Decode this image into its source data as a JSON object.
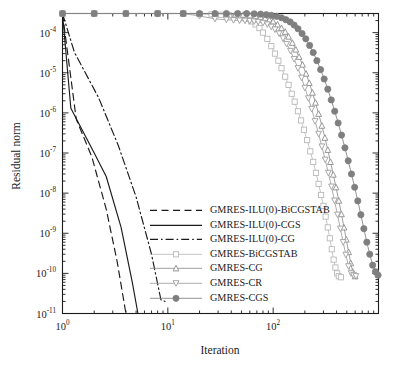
{
  "chart_data": {
    "type": "line",
    "title": "",
    "xlabel": "Iteration",
    "ylabel": "Residual norm",
    "xscale": "log",
    "yscale": "log",
    "xlim": [
      1,
      1000
    ],
    "ylim": [
      1e-11,
      0.0003
    ],
    "grid": false,
    "legend_position": "center-bottom-left",
    "xticks": [
      {
        "value": 1,
        "mantissa": "10",
        "exponent": "0"
      },
      {
        "value": 10,
        "mantissa": "10",
        "exponent": "1"
      },
      {
        "value": 100,
        "mantissa": "10",
        "exponent": "2"
      }
    ],
    "yticks": [
      {
        "value": 0.0001,
        "mantissa": "10",
        "exponent": "-4"
      },
      {
        "value": 1e-05,
        "mantissa": "10",
        "exponent": "-5"
      },
      {
        "value": 1e-06,
        "mantissa": "10",
        "exponent": "-6"
      },
      {
        "value": 1e-07,
        "mantissa": "10",
        "exponent": "-7"
      },
      {
        "value": 1e-08,
        "mantissa": "10",
        "exponent": "-8"
      },
      {
        "value": 1e-09,
        "mantissa": "10",
        "exponent": "-9"
      },
      {
        "value": 1e-10,
        "mantissa": "10",
        "exponent": "-10"
      },
      {
        "value": 1e-11,
        "mantissa": "10",
        "exponent": "-11"
      }
    ],
    "series": [
      {
        "name": "GMRES-ILU(0)-BiCGSTAB",
        "style": "dashed",
        "color": "#1a1a1a",
        "marker": "none",
        "x": [
          1,
          1.35,
          1.9,
          2.6,
          3.3,
          4.0
        ],
        "y": [
          0.0003,
          7e-07,
          8e-08,
          4e-09,
          2e-10,
          1e-11
        ]
      },
      {
        "name": "GMRES-ILU(0)-CGS",
        "style": "solid",
        "color": "#1a1a1a",
        "marker": "none",
        "x": [
          1,
          1.2,
          2.0,
          2.6,
          3.6,
          4.6,
          5.2
        ],
        "y": [
          0.0003,
          1.3e-06,
          1e-07,
          2.6e-08,
          1.4e-09,
          6e-11,
          1e-11
        ]
      },
      {
        "name": "GMRES-ILU(0)-CG",
        "style": "dashdot",
        "color": "#1a1a1a",
        "marker": "none",
        "x": [
          1,
          1.3,
          2.2,
          3.4,
          5.0,
          7.0,
          8.6,
          9.4
        ],
        "y": [
          0.0003,
          3.2e-05,
          2.4e-06,
          1.5e-07,
          8e-09,
          3e-10,
          2.2e-11,
          2e-11
        ]
      },
      {
        "name": "GMRES-BiCGSTAB",
        "style": "solid",
        "color": "#b9b9b9",
        "marker": "square",
        "x": [
          1,
          2,
          4,
          8,
          14,
          20,
          26,
          32,
          38,
          44,
          50,
          56,
          62,
          68,
          74,
          80,
          88,
          96,
          104,
          112,
          120,
          130,
          140,
          150,
          160,
          172,
          184,
          196,
          210,
          225,
          240,
          255,
          270,
          285,
          300,
          315,
          330,
          345,
          360,
          375,
          390,
          405,
          420,
          440
        ],
        "y": [
          0.0003,
          0.0003,
          0.0003,
          0.0003,
          0.0003,
          0.00029,
          0.000285,
          0.00028,
          0.00027,
          0.00026,
          0.00024,
          0.00022,
          0.00019,
          0.00016,
          0.00013,
          0.0001,
          7e-05,
          4.6e-05,
          3e-05,
          2e-05,
          1.3e-05,
          8e-06,
          5e-06,
          3e-06,
          1.9e-06,
          1.1e-06,
          6.5e-07,
          3.8e-07,
          2.1e-07,
          1.1e-07,
          6e-08,
          3.2e-08,
          1.7e-08,
          9e-09,
          4.8e-09,
          2.6e-09,
          1.4e-09,
          7.5e-10,
          4e-10,
          2.2e-10,
          1.4e-10,
          1e-10,
          8.5e-11,
          8e-11
        ]
      },
      {
        "name": "GMRES-CG",
        "style": "solid",
        "color": "#8c8c8c",
        "marker": "triangle-up",
        "x": [
          1,
          2,
          4,
          8,
          14,
          20,
          28,
          36,
          44,
          52,
          60,
          68,
          76,
          84,
          92,
          100,
          110,
          120,
          130,
          140,
          152,
          164,
          176,
          190,
          205,
          220,
          236,
          252,
          270,
          290,
          310,
          330,
          350,
          372,
          395,
          420,
          445,
          470,
          495,
          520,
          545,
          570,
          600
        ],
        "y": [
          0.0003,
          0.0003,
          0.0003,
          0.0003,
          0.0003,
          0.0003,
          0.000295,
          0.00029,
          0.000285,
          0.00028,
          0.00027,
          0.00026,
          0.000245,
          0.00023,
          0.00021,
          0.00019,
          0.00016,
          0.00013,
          0.000105,
          8e-05,
          5.6e-05,
          3.8e-05,
          2.5e-05,
          1.6e-05,
          9.5e-06,
          5.6e-06,
          3.2e-06,
          1.8e-06,
          9.5e-07,
          4.8e-07,
          2.4e-07,
          1.2e-07,
          6e-08,
          2.9e-08,
          1.4e-08,
          6.5e-09,
          3e-09,
          1.4e-09,
          7e-10,
          3.4e-10,
          1.8e-10,
          1.1e-10,
          8.5e-11
        ]
      },
      {
        "name": "GMRES-CR",
        "style": "solid",
        "color": "#9e9e9e",
        "marker": "triangle-down",
        "x": [
          1,
          2,
          4,
          8,
          14,
          20,
          28,
          36,
          42,
          48,
          54,
          60,
          66,
          72,
          80,
          88,
          96,
          104,
          114,
          124,
          134,
          146,
          158,
          172,
          186,
          200,
          216,
          232,
          250,
          270,
          290,
          312,
          334,
          358,
          382,
          408,
          435,
          462,
          490,
          520,
          550,
          580,
          610
        ],
        "y": [
          0.0003,
          0.0003,
          0.0003,
          0.0003,
          0.0003,
          0.00026,
          0.00022,
          0.00021,
          0.000205,
          0.0002,
          0.000198,
          0.000195,
          0.00019,
          0.000185,
          0.000175,
          0.00016,
          0.00014,
          0.00012,
          9.5e-05,
          7.2e-05,
          5.2e-05,
          3.5e-05,
          2.2e-05,
          1.3e-05,
          7.5e-06,
          4.2e-06,
          2.3e-06,
          1.25e-06,
          6.2e-07,
          3e-07,
          1.45e-07,
          6.8e-08,
          3.2e-08,
          1.45e-08,
          6.5e-09,
          2.9e-09,
          1.3e-09,
          6e-10,
          2.9e-10,
          1.5e-10,
          1e-10,
          9e-11,
          8.5e-11
        ]
      },
      {
        "name": "GMRES-CGS",
        "style": "solid",
        "color": "#7f7f7f",
        "marker": "circle",
        "x": [
          1,
          2,
          4,
          8,
          14,
          20,
          28,
          36,
          46,
          56,
          66,
          76,
          86,
          96,
          108,
          120,
          132,
          145,
          158,
          172,
          188,
          204,
          222,
          240,
          260,
          282,
          305,
          330,
          356,
          384,
          414,
          446,
          480,
          516,
          554,
          594,
          636,
          680,
          726,
          775,
          826,
          880,
          935,
          990
        ],
        "y": [
          0.0003,
          0.0003,
          0.0003,
          0.0003,
          0.0003,
          0.0003,
          0.0003,
          0.0003,
          0.0003,
          0.0003,
          0.000295,
          0.00029,
          0.00028,
          0.00027,
          0.000255,
          0.000235,
          0.00021,
          0.000185,
          0.000155,
          0.000125,
          9.5e-05,
          7e-05,
          4.8e-05,
          3.2e-05,
          2e-05,
          1.2e-05,
          7e-06,
          3.9e-06,
          2.1e-06,
          1.1e-06,
          5.6e-07,
          2.8e-07,
          1.35e-07,
          6.4e-08,
          3e-08,
          1.4e-08,
          6.4e-09,
          2.9e-09,
          1.3e-09,
          6e-10,
          3e-10,
          1.6e-10,
          1.1e-10,
          9e-11
        ]
      }
    ]
  },
  "legend": {
    "entries": [
      {
        "label": "GMRES-ILU(0)-BiCGSTAB",
        "style": "dashed",
        "color": "#1a1a1a",
        "marker": "none"
      },
      {
        "label": "GMRES-ILU(0)-CGS",
        "style": "solid",
        "color": "#1a1a1a",
        "marker": "none"
      },
      {
        "label": "GMRES-ILU(0)-CG",
        "style": "dashdot",
        "color": "#1a1a1a",
        "marker": "none"
      },
      {
        "label": "GMRES-BiCGSTAB",
        "style": "solid",
        "color": "#b9b9b9",
        "marker": "square"
      },
      {
        "label": "GMRES-CG",
        "style": "solid",
        "color": "#8c8c8c",
        "marker": "triangle-up"
      },
      {
        "label": "GMRES-CR",
        "style": "solid",
        "color": "#9e9e9e",
        "marker": "triangle-down"
      },
      {
        "label": "GMRES-CGS",
        "style": "solid",
        "color": "#7f7f7f",
        "marker": "circle"
      }
    ]
  },
  "axes": {
    "xlabel": "Iteration",
    "ylabel": "Residual norm"
  }
}
